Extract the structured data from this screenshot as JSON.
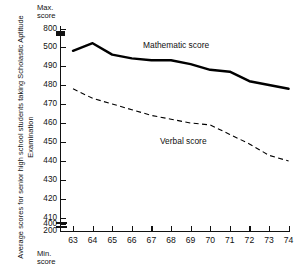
{
  "axis": {
    "y_title": "Average scores for senior high school students taking Scholastic Aptitude Examination",
    "max_caption": "Max.\nscore",
    "min_caption": "Min.\nscore"
  },
  "labels": {
    "math": "Mathematic score",
    "verbal": "Verbal score"
  },
  "chart_data": {
    "type": "line",
    "title": "",
    "subtitle": "",
    "xlabel": "",
    "ylabel": "Average scores for senior high school students taking Scholastic Aptitude Examination",
    "x": [
      63,
      64,
      65,
      66,
      67,
      68,
      69,
      70,
      71,
      72,
      73,
      74
    ],
    "x_tick_labels": [
      "63",
      "64",
      "65",
      "66",
      "67",
      "68",
      "69",
      "70",
      "71",
      "72",
      "73",
      "74"
    ],
    "y_tick_labels": [
      "800",
      "500",
      "490",
      "480",
      "470",
      "460",
      "450",
      "440",
      "430",
      "420",
      "410",
      "400",
      "200"
    ],
    "y_tick_values": [
      800,
      500,
      490,
      480,
      470,
      460,
      450,
      440,
      430,
      420,
      410,
      400,
      200
    ],
    "y_axis_broken": true,
    "y_break_notes": "Axis broken between 800 and 500, and between 400 and 200",
    "ylim": [
      200,
      800
    ],
    "grid": false,
    "legend": "inline-labels",
    "series": [
      {
        "name": "Mathematic score",
        "style": "solid",
        "color": "#000000",
        "values": [
          498,
          502,
          496,
          494,
          493,
          493,
          491,
          488,
          487,
          482,
          480,
          478
        ]
      },
      {
        "name": "Verbal score",
        "style": "dashed",
        "color": "#000000",
        "values": [
          478,
          473,
          470,
          467,
          464,
          462,
          460,
          459,
          454,
          449,
          443,
          440
        ]
      }
    ],
    "annotations": [
      {
        "text": "Max.\nscore",
        "position": "above-y-axis"
      },
      {
        "text": "Min.\nscore",
        "position": "below-y-axis"
      },
      {
        "text": "Mathematic score",
        "position": "inline-upper-series"
      },
      {
        "text": "Verbal score",
        "position": "inline-lower-series"
      }
    ]
  }
}
